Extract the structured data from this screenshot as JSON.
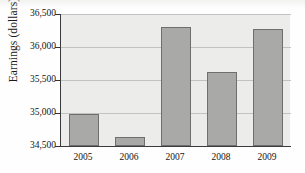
{
  "chart_data": {
    "type": "bar",
    "title": "",
    "xlabel": "",
    "ylabel": "Earnings (dollars)",
    "categories": [
      "2005",
      "2006",
      "2007",
      "2008",
      "2009"
    ],
    "values": [
      34980,
      34630,
      36310,
      35620,
      36280
    ],
    "ylim": [
      34500,
      36500
    ],
    "yticks": [
      34500,
      35000,
      35500,
      36000,
      36500
    ],
    "ytick_labels": [
      "34,500",
      "35,000",
      "35,500",
      "36,000",
      "36,500"
    ],
    "grid": true,
    "legend": "none",
    "series": [
      {
        "name": "Earnings",
        "values": [
          34980,
          34630,
          36310,
          35620,
          36280
        ]
      }
    ],
    "colors": {
      "bar_fill": "#a9a9a7",
      "bar_stroke": "#6f6f6d",
      "plot_background": "#ececeb",
      "gridline": "#c2c2c0",
      "axis": "#3a3a3a",
      "text": "#141414"
    }
  }
}
